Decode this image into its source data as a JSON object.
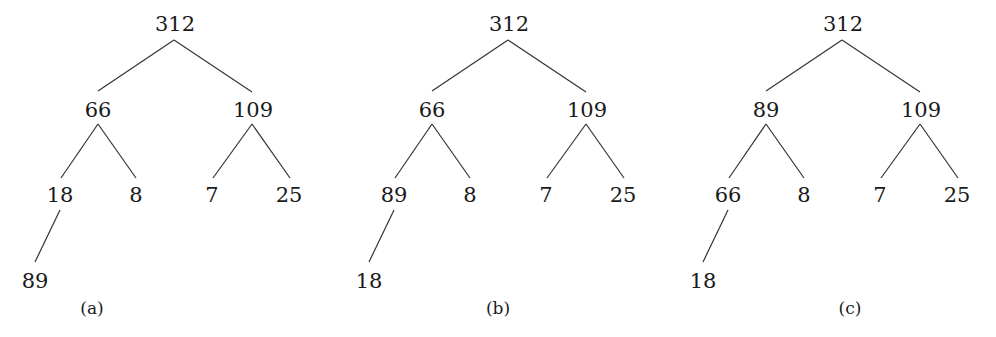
{
  "figure": {
    "trees": [
      {
        "label": "(a)",
        "nodes": {
          "root": "312",
          "l": "66",
          "r": "109",
          "ll": "18",
          "lr": "8",
          "rl": "7",
          "rr": "25",
          "lll": "89"
        }
      },
      {
        "label": "(b)",
        "nodes": {
          "root": "312",
          "l": "66",
          "r": "109",
          "ll": "89",
          "lr": "8",
          "rl": "7",
          "rr": "25",
          "lll": "18"
        }
      },
      {
        "label": "(c)",
        "nodes": {
          "root": "312",
          "l": "89",
          "r": "109",
          "ll": "66",
          "lr": "8",
          "rl": "7",
          "rr": "25",
          "lll": "18"
        }
      }
    ]
  }
}
